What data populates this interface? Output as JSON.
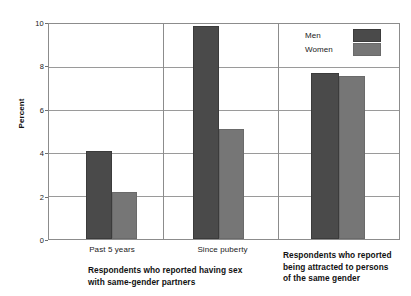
{
  "chart_data": {
    "type": "bar",
    "title": "",
    "xlabel": "",
    "ylabel": "Percent",
    "ylim": [
      0,
      10
    ],
    "yticks": [
      "0",
      "2",
      "4",
      "6",
      "8",
      "10"
    ],
    "grid": true,
    "legend_position": "top-right",
    "categories": [
      "Past 5 years",
      "Since puberty",
      "Respondents who reported being attracted to persons of the same gender"
    ],
    "series": [
      {
        "name": "Men",
        "color": "#4a4a4a",
        "values": [
          4.0,
          9.8,
          7.65
        ]
      },
      {
        "name": "Women",
        "color": "#767676",
        "values": [
          2.1,
          5.0,
          7.5
        ]
      }
    ],
    "panels": [
      {
        "caption": "Respondents who reported having sex with same-gender partners",
        "caption_line1": "Respondents who reported having sex",
        "caption_line2": "with same-gender partners",
        "groups": [
          {
            "label": "Past 5 years",
            "men": 4.0,
            "women": 2.1
          },
          {
            "label": "Since puberty",
            "men": 9.8,
            "women": 5.0
          }
        ]
      },
      {
        "caption": "Respondents who reported being attracted to persons of the same gender",
        "caption_line1": "Respondents who reported",
        "caption_line2": "being attracted to persons",
        "caption_line3": "of the same gender",
        "groups": [
          {
            "label": "",
            "men": 7.65,
            "women": 7.5
          }
        ]
      }
    ]
  },
  "axis": {
    "y_title": "Percent",
    "tick_10": "10",
    "tick_8": "8",
    "tick_6": "6",
    "tick_4": "4",
    "tick_2": "2",
    "tick_0": "0"
  },
  "legend": {
    "men_label": "Men",
    "women_label": "Women"
  },
  "xlabels": {
    "past_5_years": "Past 5 years",
    "since_puberty": "Since puberty"
  },
  "captions": {
    "left_line1": "Respondents who reported having sex",
    "left_line2": "with same-gender partners",
    "right_line1": "Respondents who reported",
    "right_line2": "being attracted to persons",
    "right_line3": "of the same gender"
  },
  "colors": {
    "men": "#4a4a4a",
    "women": "#767676",
    "grid": "#9a9a9a",
    "frame": "#8c8c8c",
    "background": "#ffffff"
  }
}
